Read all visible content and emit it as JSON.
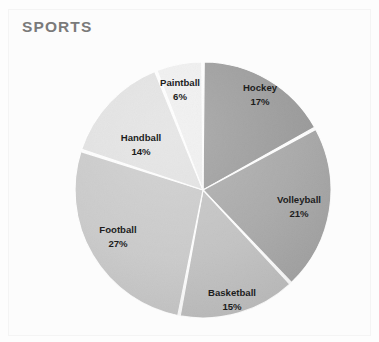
{
  "card": {
    "title": "SPORTS",
    "top_clipped_text": "·                    ·"
  },
  "chart_data": {
    "type": "pie",
    "title": "SPORTS",
    "xlabel": "",
    "ylabel": "",
    "legend_position": "none",
    "labels_inside_slices": true,
    "start_angle_deg": 0,
    "direction": "clockwise",
    "categories": [
      "Hockey",
      "Volleyball",
      "Basketball",
      "Football",
      "Handball",
      "Paintball"
    ],
    "values": [
      17,
      21,
      15,
      27,
      14,
      6
    ],
    "value_unit": "%",
    "colors": [
      "#9a9a9a",
      "#a8a8a8",
      "#c2c2c2",
      "#cacaca",
      "#e2e2e2",
      "#efefef"
    ],
    "slices": [
      {
        "label": "Hockey",
        "percent": "17%",
        "value": 17,
        "color": "#9a9a9a",
        "label_x": 260,
        "label_y": 91,
        "pct_y": 105
      },
      {
        "label": "Volleyball",
        "percent": "21%",
        "value": 21,
        "color": "#a8a8a8",
        "label_x": 299,
        "label_y": 203,
        "pct_y": 217
      },
      {
        "label": "Basketball",
        "percent": "15%",
        "value": 15,
        "color": "#c2c2c2",
        "label_x": 232,
        "label_y": 296,
        "pct_y": 310
      },
      {
        "label": "Football",
        "percent": "27%",
        "value": 27,
        "color": "#cacaca",
        "label_x": 118,
        "label_y": 233,
        "pct_y": 247
      },
      {
        "label": "Handball",
        "percent": "14%",
        "value": 14,
        "color": "#e2e2e2",
        "label_x": 141,
        "label_y": 141,
        "pct_y": 155
      },
      {
        "label": "Paintball",
        "percent": "6%",
        "value": 6,
        "color": "#efefef",
        "label_x": 180,
        "label_y": 86,
        "pct_y": 100
      }
    ],
    "geometry": {
      "cx": 203,
      "cy": 190,
      "r": 128,
      "gap_deg": 1.1
    }
  }
}
